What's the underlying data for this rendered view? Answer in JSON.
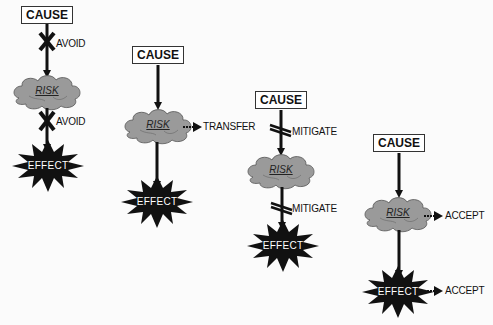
{
  "diagram": {
    "colors": {
      "cloud": "#9a9a9a",
      "effect": "#111111",
      "arrow": "#111111",
      "box_border": "#333333"
    },
    "columns": [
      {
        "cause": "CAUSE",
        "risk": "RISK",
        "effect": "EFFECT",
        "strategy": "AVOID",
        "labels": [
          "AVOID",
          "AVOID"
        ]
      },
      {
        "cause": "CAUSE",
        "risk": "RISK",
        "effect": "EFFECT",
        "strategy": "TRANSFER",
        "labels": [
          "TRANSFER"
        ]
      },
      {
        "cause": "CAUSE",
        "risk": "RISK",
        "effect": "EFFECT",
        "strategy": "MITIGATE",
        "labels": [
          "MITIGATE",
          "MITIGATE"
        ]
      },
      {
        "cause": "CAUSE",
        "risk": "RISK",
        "effect": "EFFECT",
        "strategy": "ACCEPT",
        "labels": [
          "ACCEPT",
          "ACCEPT"
        ]
      }
    ]
  }
}
